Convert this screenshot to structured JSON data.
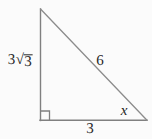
{
  "figure": {
    "type": "right-triangle-diagram",
    "canvas": {
      "width": 152,
      "height": 139,
      "background": "#fbfbfb"
    },
    "stroke_color": "#808080",
    "text_color": "#262626",
    "vertices": {
      "apex": {
        "x": 40,
        "y": 9
      },
      "right_angle": {
        "x": 40,
        "y": 120
      },
      "base_right": {
        "x": 147,
        "y": 120
      }
    },
    "right_angle_marker": {
      "x": 40,
      "y": 120,
      "size": 9
    },
    "labels": {
      "leg_vertical": {
        "coefficient": "3",
        "radical": "√",
        "radicand": "3",
        "full_text": "3√3"
      },
      "hypotenuse": "6",
      "angle": "x",
      "leg_base": "3"
    }
  }
}
